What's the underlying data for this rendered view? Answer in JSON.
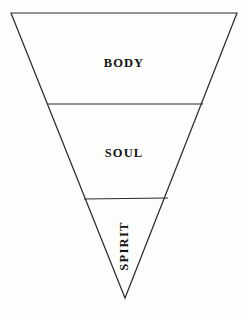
{
  "figure": {
    "shape": "inverted-triangle",
    "background_color": "#fdfdfc",
    "stroke_color": "#2b2b2b",
    "text_color": "#14120f",
    "canvas": {
      "width": 248,
      "height": 320
    }
  },
  "geometry": {
    "outline_points": "11,13 237,13 125,298",
    "vertices": {
      "top_left": [
        11,
        13
      ],
      "top_right": [
        237,
        13
      ],
      "apex_bottom": [
        125,
        298
      ]
    },
    "dividers": [
      {
        "name": "body-soul-divider",
        "x1": 47,
        "y1": 104,
        "x2": 203,
        "y2": 104
      },
      {
        "name": "soul-spirit-divider",
        "x1": 84,
        "y1": 199,
        "x2": 168,
        "y2": 198
      }
    ]
  },
  "tiers": [
    {
      "id": "body",
      "label": "BODY",
      "order": 1,
      "orientation": "horizontal",
      "position": "top"
    },
    {
      "id": "soul",
      "label": "SOUL",
      "order": 2,
      "orientation": "horizontal",
      "position": "middle"
    },
    {
      "id": "spirit",
      "label": "SPIRIT",
      "order": 3,
      "orientation": "vertical-rotated-90-ccw",
      "position": "bottom"
    }
  ]
}
